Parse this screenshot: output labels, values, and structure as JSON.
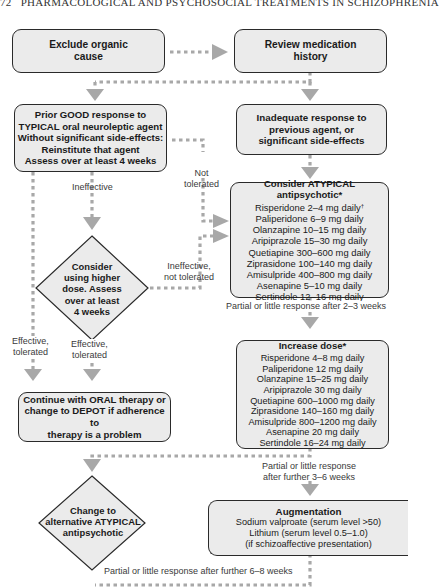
{
  "header": {
    "page_number": "72",
    "running_title": "PHARMACOLOGICAL AND PSYCHOSOCIAL TREATMENTS IN SCHIZOPHRENIA"
  },
  "nodes": {
    "exclude_organic": {
      "lines": [
        "Exclude organic",
        "cause"
      ]
    },
    "review_history": {
      "lines": [
        "Review medication",
        "history"
      ]
    },
    "prior_good": {
      "lines": [
        "Prior GOOD response to",
        "TYPICAL oral neuroleptic agent",
        "Without significant side-effects:",
        "Reinstitute that agent",
        "Assess over at least 4 weeks"
      ]
    },
    "inadequate": {
      "lines": [
        "Inadequate response to",
        "previous agent, or",
        "significant side-effects"
      ]
    },
    "consider_atypical": {
      "title": "Consider ATYPICAL antipsychotic*",
      "items": [
        {
          "text": "Risperidone 2–4 mg daily",
          "mark": "†"
        },
        {
          "text": "Paliperidone 6–9 mg daily"
        },
        {
          "text": "Olanzapine 10–15 mg daily"
        },
        {
          "text": "Aripiprazole 15–30 mg daily"
        },
        {
          "text": "Quetiapine 300–600 mg daily"
        },
        {
          "text": "Ziprasidone 100–140 mg daily"
        },
        {
          "text": "Amisulpride 400–800 mg daily"
        },
        {
          "text": "Asenapine 5–10 mg daily"
        },
        {
          "text": "Sertindole 12–16 mg daily"
        }
      ]
    },
    "higher_dose": {
      "lines": [
        "Consider",
        "using higher",
        "dose. Assess",
        "over at least",
        "4 weeks"
      ]
    },
    "increase_dose": {
      "title": "Increase dose*",
      "items": [
        "Risperidone 4–8 mg daily",
        "Paliperidone 12 mg daily",
        "Olanzapine 15–25 mg daily",
        "Aripiprazole 30 mg daily",
        "Quetiapine 600–1000 mg daily",
        "Ziprasidone 140–160 mg daily",
        "Amisulpride 800–1200 mg daily",
        "Asenapine 20 mg daily",
        "Sertindole 16–24 mg daily"
      ]
    },
    "continue_oral": {
      "lines": [
        "Continue with ORAL therapy or",
        "change to DEPOT if adherence to",
        "therapy is a problem"
      ]
    },
    "change_alternative": {
      "lines": [
        "Change to",
        "alternative ATYPICAL",
        "antipsychotic"
      ]
    },
    "augmentation": {
      "title": "Augmentation",
      "items": [
        "Sodium valproate (serum level >50)",
        "Lithium (serum level 0.5–1.0)",
        "(if schizoaffective presentation)"
      ]
    }
  },
  "edge_labels": {
    "ineffective": "Ineffective",
    "not_tolerated": [
      "Not",
      "tolerated"
    ],
    "ineffective_not_tolerated": [
      "Ineffective,",
      "not tolerated"
    ],
    "effective_tolerated_left": [
      "Effective,",
      "tolerated"
    ],
    "effective_tolerated_mid": [
      "Effective,",
      "tolerated"
    ],
    "partial_2_3": "Partial or little response after 2–3 weeks",
    "partial_3_6": [
      "Partial or little response",
      "after further 3–6 weeks"
    ],
    "partial_6_8": "Partial or little response after further 6–8 weeks"
  },
  "colors": {
    "box_fill": "#ebebeb",
    "box_border": "#2a2a2a",
    "connector": "#a8a8a8",
    "text": "#1a1a1a"
  }
}
